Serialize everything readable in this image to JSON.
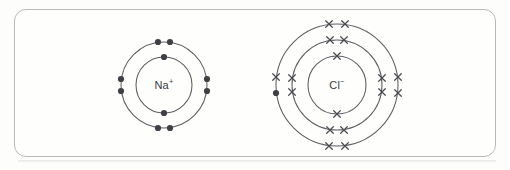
{
  "diagram": {
    "background_color": "#fdfdfc",
    "frame": {
      "border_color": "#b9b9bb",
      "fill_color": "#fefefd",
      "corner_radius": 12
    },
    "ions": [
      {
        "id": "sodium",
        "label_text": "Na",
        "charge": "+",
        "center": {
          "x": 164,
          "y": 85
        },
        "electron_symbol": "dot",
        "dot_color": "#3f3f45",
        "ring_color": "#5e5e63",
        "shells": [
          {
            "name": "inner-shell",
            "radius": 28,
            "electron_count": 2,
            "marks": [
              {
                "symbol": "dot",
                "angle_deg": 270,
                "offset_along": 0
              },
              {
                "symbol": "dot",
                "angle_deg": 90,
                "offset_along": 0
              }
            ]
          },
          {
            "name": "outer-shell",
            "radius": 43,
            "electron_count": 8,
            "marks": [
              {
                "symbol": "dot",
                "angle_deg": 270,
                "offset_along": -6
              },
              {
                "symbol": "dot",
                "angle_deg": 270,
                "offset_along": 6
              },
              {
                "symbol": "dot",
                "angle_deg": 90,
                "offset_along": -6
              },
              {
                "symbol": "dot",
                "angle_deg": 90,
                "offset_along": 6
              },
              {
                "symbol": "dot",
                "angle_deg": 180,
                "offset_along": -6
              },
              {
                "symbol": "dot",
                "angle_deg": 180,
                "offset_along": 6
              },
              {
                "symbol": "dot",
                "angle_deg": 0,
                "offset_along": -6
              },
              {
                "symbol": "dot",
                "angle_deg": 0,
                "offset_along": 6
              }
            ]
          }
        ]
      },
      {
        "id": "chloride",
        "label_text": "Cl",
        "charge": "−",
        "center": {
          "x": 337,
          "y": 85
        },
        "electron_symbol": "cross",
        "dot_color": "#3f3f45",
        "cross_color": "#4b4b51",
        "ring_color": "#5e5e63",
        "shells": [
          {
            "name": "inner-shell",
            "radius": 29,
            "electron_count": 2,
            "marks": [
              {
                "symbol": "cross",
                "angle_deg": 270,
                "offset_along": 0
              },
              {
                "symbol": "cross",
                "angle_deg": 90,
                "offset_along": 0
              }
            ]
          },
          {
            "name": "middle-shell",
            "radius": 45,
            "electron_count": 8,
            "marks": [
              {
                "symbol": "cross",
                "angle_deg": 270,
                "offset_along": -7
              },
              {
                "symbol": "cross",
                "angle_deg": 270,
                "offset_along": 7
              },
              {
                "symbol": "cross",
                "angle_deg": 90,
                "offset_along": -7
              },
              {
                "symbol": "cross",
                "angle_deg": 90,
                "offset_along": 7
              },
              {
                "symbol": "cross",
                "angle_deg": 180,
                "offset_along": -7
              },
              {
                "symbol": "cross",
                "angle_deg": 180,
                "offset_along": 7
              },
              {
                "symbol": "cross",
                "angle_deg": 0,
                "offset_along": -7
              },
              {
                "symbol": "cross",
                "angle_deg": 0,
                "offset_along": 7
              }
            ]
          },
          {
            "name": "outer-shell",
            "radius": 61,
            "electron_count": 8,
            "transferred_electron_note": "upper-left mark drawn as a filled dot representing the electron transferred from sodium",
            "marks": [
              {
                "symbol": "cross",
                "angle_deg": 270,
                "offset_along": -8
              },
              {
                "symbol": "cross",
                "angle_deg": 270,
                "offset_along": 8
              },
              {
                "symbol": "cross",
                "angle_deg": 90,
                "offset_along": -8
              },
              {
                "symbol": "cross",
                "angle_deg": 90,
                "offset_along": 8
              },
              {
                "symbol": "dot",
                "angle_deg": 180,
                "offset_along": -8
              },
              {
                "symbol": "cross",
                "angle_deg": 180,
                "offset_along": 8
              },
              {
                "symbol": "cross",
                "angle_deg": 0,
                "offset_along": -8
              },
              {
                "symbol": "cross",
                "angle_deg": 0,
                "offset_along": 8
              }
            ]
          }
        ]
      }
    ]
  }
}
